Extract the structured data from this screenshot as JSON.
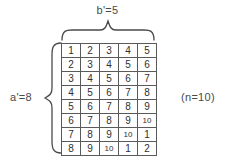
{
  "labels": {
    "top": "b'=5",
    "left": "a'=8",
    "right_note": "(n=10)"
  },
  "colors": {
    "background": "#ffffff",
    "grid_line": "#5a5a5a",
    "text": "#3a3a3a"
  },
  "chart_data": {
    "type": "table",
    "title": "",
    "rows": 8,
    "columns": 5,
    "values": [
      [
        1,
        2,
        3,
        4,
        5
      ],
      [
        2,
        3,
        4,
        5,
        6
      ],
      [
        3,
        4,
        5,
        6,
        7
      ],
      [
        4,
        5,
        6,
        7,
        8
      ],
      [
        5,
        6,
        7,
        8,
        9
      ],
      [
        6,
        7,
        8,
        9,
        10
      ],
      [
        7,
        8,
        9,
        10,
        1
      ],
      [
        8,
        9,
        10,
        1,
        2
      ]
    ]
  }
}
